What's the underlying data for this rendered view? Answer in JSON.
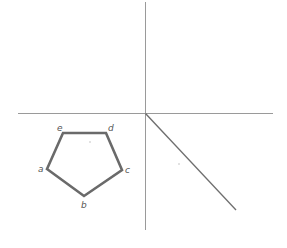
{
  "diagram": {
    "type": "projection-construction",
    "axes": {
      "vertical": {
        "x": 145,
        "y1": 2,
        "y2": 230
      },
      "horizontal": {
        "y": 113,
        "x1": 18,
        "x2": 273
      },
      "diagonal": {
        "x1": 145,
        "y1": 113,
        "x2": 236,
        "y2": 210
      }
    },
    "pentagon": {
      "vertices": [
        {
          "label": "a",
          "x": 47,
          "y": 169
        },
        {
          "label": "b",
          "x": 84,
          "y": 196
        },
        {
          "label": "c",
          "x": 122,
          "y": 170
        },
        {
          "label": "d",
          "x": 106,
          "y": 133
        },
        {
          "label": "e",
          "x": 63,
          "y": 133
        }
      ]
    },
    "labels": {
      "a": "a",
      "b": "b",
      "c": "c",
      "d": "d",
      "e": "e"
    },
    "colors": {
      "axis": "#9a9a9a",
      "pentagon": "#6a6a6a",
      "label": "#555555"
    }
  }
}
